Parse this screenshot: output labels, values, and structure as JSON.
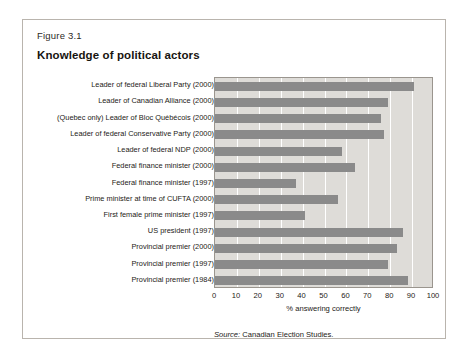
{
  "figure": {
    "number": "Figure 3.1",
    "title": "Knowledge of political actors",
    "source_label": "Source:",
    "source_text": " Canadian Election Studies."
  },
  "colors": {
    "bar": "#8a8a8a",
    "plot_background": "#dedcd8",
    "gridline": "#ffffff",
    "border": "#9a958e",
    "card_border": "#b9b4ad",
    "text": "#1d1a16"
  },
  "chart_data": {
    "type": "bar",
    "orientation": "horizontal",
    "title": "Knowledge of political actors",
    "xlabel": "% answering correctly",
    "ylabel": "",
    "xlim": [
      0,
      100
    ],
    "grid": true,
    "legend": null,
    "tick_labels": [
      "0",
      "10",
      "20",
      "30",
      "40",
      "50",
      "60",
      "70",
      "80",
      "90",
      "100"
    ],
    "ticks": [
      0,
      10,
      20,
      30,
      40,
      50,
      60,
      70,
      80,
      90,
      100
    ],
    "categories": [
      "Leader of federal Liberal Party (2000)",
      "Leader of Canadian Alliance (2000)",
      "(Quebec only) Leader of Bloc Québécois (2000)",
      "Leader of federal Conservative Party (2000)",
      "Leader of federal NDP (2000)",
      "Federal finance minister (2000)",
      "Federal finance minister (1997)",
      "Prime minister at time of CUFTA (2000)",
      "First female prime minister (1997)",
      "US president (1997)",
      "Provincial premier (2000)",
      "Provincial premier (1997)",
      "Provincial premier (1984)"
    ],
    "values": [
      91,
      79,
      76,
      77,
      58,
      64,
      37,
      56,
      41,
      86,
      83,
      79,
      88
    ]
  }
}
